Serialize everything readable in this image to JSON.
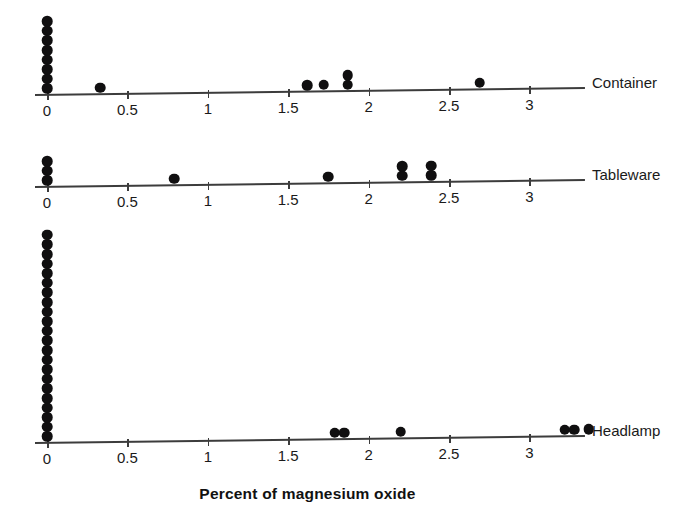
{
  "chart_data": {
    "type": "scatter",
    "title": "",
    "subtitle": "",
    "xlabel": "Percent of magnesium oxide",
    "ylabel": "",
    "xlim": [
      -0.08,
      3.45
    ],
    "grid": false,
    "legend": "none",
    "plot_style": "stacked dot plot (one dot per observation), three horizontal panels sharing a common x-axis",
    "xticks": [
      0,
      0.5,
      1,
      1.5,
      2,
      2.5,
      3
    ],
    "xtick_labels": [
      "0",
      "0.5",
      "1",
      "1.5",
      "2",
      "2.5",
      "3"
    ],
    "panels": [
      {
        "label": "Container",
        "n": 13,
        "stacks": [
          {
            "x": 0.0,
            "count": 8
          },
          {
            "x": 0.33,
            "count": 1
          },
          {
            "x": 1.62,
            "count": 1
          },
          {
            "x": 1.72,
            "count": 1
          },
          {
            "x": 1.87,
            "count": 2
          },
          {
            "x": 2.69,
            "count": 1
          }
        ],
        "values": [
          0,
          0,
          0,
          0,
          0,
          0,
          0,
          0,
          0.33,
          1.62,
          1.72,
          1.87,
          1.87,
          2.69
        ]
      },
      {
        "label": "Tableware",
        "n": 9,
        "stacks": [
          {
            "x": 0.0,
            "count": 3
          },
          {
            "x": 0.79,
            "count": 1
          },
          {
            "x": 1.75,
            "count": 1
          },
          {
            "x": 2.21,
            "count": 2
          },
          {
            "x": 2.39,
            "count": 2
          }
        ],
        "values": [
          0,
          0,
          0,
          0.79,
          1.75,
          2.21,
          2.21,
          2.39,
          2.39
        ]
      },
      {
        "label": "Headlamp",
        "n": 28,
        "stacks": [
          {
            "x": 0.0,
            "count": 22
          },
          {
            "x": 1.79,
            "count": 1
          },
          {
            "x": 1.85,
            "count": 1
          },
          {
            "x": 2.2,
            "count": 1
          },
          {
            "x": 3.22,
            "count": 1
          },
          {
            "x": 3.28,
            "count": 1
          },
          {
            "x": 3.37,
            "count": 1
          }
        ],
        "values": [
          0,
          0,
          0,
          0,
          0,
          0,
          0,
          0,
          0,
          0,
          0,
          0,
          0,
          0,
          0,
          0,
          0,
          0,
          0,
          0,
          0,
          0,
          1.79,
          1.85,
          2.2,
          3.22,
          3.28,
          3.37
        ]
      }
    ],
    "colors": {
      "dot": "#100f10",
      "axis": "#3c3c3c",
      "text": "#1a1a1a",
      "background": "#ffffff"
    }
  }
}
